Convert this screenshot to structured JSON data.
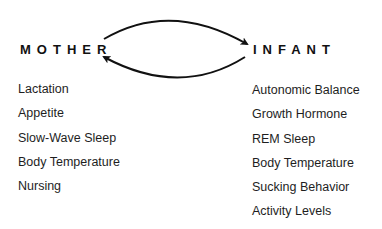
{
  "diagram": {
    "nodes": {
      "mother": {
        "label": "MOTHER"
      },
      "infant": {
        "label": "INFANT"
      }
    },
    "edges": [
      {
        "from": "mother",
        "to": "infant",
        "style": "curved-arrow-top"
      },
      {
        "from": "infant",
        "to": "mother",
        "style": "curved-arrow-bottom"
      }
    ],
    "mother_items": [
      "Lactation",
      "Appetite",
      "Slow-Wave Sleep",
      "Body Temperature",
      "Nursing"
    ],
    "infant_items": [
      "Autonomic Balance",
      "Growth Hormone",
      "REM Sleep",
      "Body Temperature",
      "Sucking Behavior",
      "Activity Levels"
    ],
    "colors": {
      "ink": "#111111",
      "background": "#ffffff"
    }
  }
}
